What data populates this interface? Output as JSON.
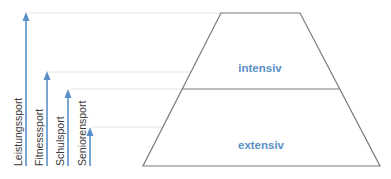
{
  "colors": {
    "accent": "#5b8fc7",
    "outline": "#7a7a7a",
    "guide": "#e4e4e4",
    "text": "#3a3a3a"
  },
  "pyramid": {
    "levels": [
      {
        "label": "intensiv"
      },
      {
        "label": "extensiv"
      }
    ]
  },
  "sports": [
    {
      "label": "Leistungssport"
    },
    {
      "label": "Fitnesssport"
    },
    {
      "label": "Schulsport"
    },
    {
      "label": "Seniorensport"
    }
  ]
}
